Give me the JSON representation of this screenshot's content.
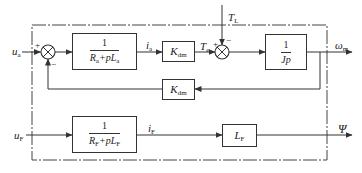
{
  "diagram": {
    "type": "block-diagram",
    "title": "",
    "inputs": {
      "armature_voltage": {
        "symbol": "u",
        "sub": "a"
      },
      "field_voltage": {
        "symbol": "u",
        "sub": "F"
      },
      "load_torque": {
        "symbol": "T",
        "sub": "L"
      }
    },
    "outputs": {
      "speed": {
        "symbol": "ω",
        "sub": "m"
      },
      "flux": {
        "symbol": "Ψ",
        "sub": ""
      }
    },
    "signals": {
      "armature_current": {
        "symbol": "i",
        "sub": "a"
      },
      "electromagnetic_torque": {
        "symbol": "T",
        "sub": "e"
      },
      "field_current": {
        "symbol": "i",
        "sub": "F"
      }
    },
    "blocks": {
      "armature": {
        "numerator": "1",
        "den_parts": [
          {
            "t": "R",
            "s": "a"
          },
          {
            "t": "+pL",
            "s": "a"
          }
        ]
      },
      "torque_const": {
        "main": "K",
        "sub": "dm"
      },
      "mechanical": {
        "numerator": "1",
        "denominator": "Jp"
      },
      "back_emf": {
        "main": "K",
        "sub": "dm"
      },
      "field": {
        "numerator": "1",
        "den_parts": [
          {
            "t": "R",
            "s": "F"
          },
          {
            "t": "+pL",
            "s": "F"
          }
        ]
      },
      "field_inductance": {
        "main": "L",
        "sub": "F"
      }
    },
    "summing_junctions": {
      "sum1": {
        "plus_label": "+",
        "minus_label": "−"
      },
      "sum2": {
        "plus_label": "+",
        "minus_label": "−"
      }
    },
    "colors": {
      "line": "#333333",
      "background": "#ffffff"
    }
  }
}
